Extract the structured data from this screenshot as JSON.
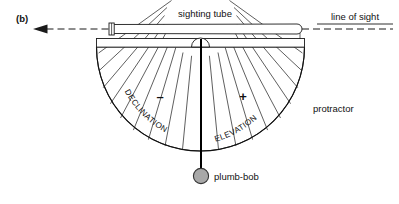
{
  "figure": {
    "panel_label": "(b)",
    "labels": {
      "sighting_tube": "sighting tube",
      "line_of_sight": "line of sight",
      "protractor": "protractor",
      "plumb_bob": "plumb-bob",
      "declination": "DECLINATION",
      "elevation": "ELEVATION",
      "minus_sign": "–",
      "plus_sign": "+"
    },
    "colors": {
      "ink": "#1a1a1a",
      "background": "#ffffff",
      "plumb_bob_fill": "#a8a8a8",
      "plumb_bob_stroke": "#333333"
    },
    "geometry": {
      "center_x": 200.5,
      "center_y": 47,
      "outer_radius": 104,
      "inner_hub_radius": 9,
      "tick_step_degrees": 10,
      "sweep_degrees": 180,
      "plumb_line_length": 125,
      "plumb_bob_radius": 7.5
    }
  }
}
